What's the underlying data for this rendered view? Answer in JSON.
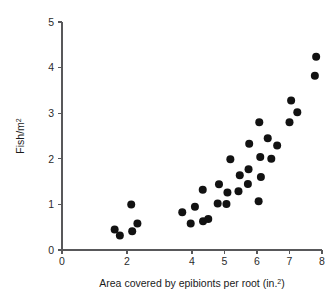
{
  "chart_data": {
    "type": "scatter",
    "title": "",
    "xlabel": "Area covered by epibionts per root (in.²)",
    "ylabel": "Fish/m²",
    "xlabel_main": "Area covered by epibionts per root (in.",
    "xlabel_sup": "2",
    "xlabel_tail": ")",
    "ylabel_main": "Fish/m",
    "ylabel_sup": "2",
    "xlim": [
      0,
      8
    ],
    "ylim": [
      0,
      5
    ],
    "xticks": [
      0,
      2,
      4,
      5,
      6,
      7,
      8
    ],
    "xtick_labels": [
      "0",
      "2",
      "4",
      "5",
      "6",
      "7",
      "8"
    ],
    "yticks": [
      0,
      1,
      2,
      3,
      4,
      5
    ],
    "ytick_labels": [
      "0",
      "1",
      "2",
      "3",
      "4",
      "5"
    ],
    "grid": false,
    "legend": false,
    "marker": "filled-circle",
    "marker_color": "#121212",
    "marker_size": 5.2,
    "n_points": 38,
    "x": [
      1.62,
      1.78,
      2.13,
      2.16,
      2.32,
      3.7,
      3.96,
      4.09,
      4.33,
      4.34,
      4.5,
      4.79,
      4.83,
      5.06,
      5.09,
      5.18,
      5.43,
      5.47,
      5.72,
      5.74,
      5.76,
      6.05,
      6.07,
      6.1,
      6.12,
      6.14,
      6.33,
      6.44,
      6.62,
      7.0,
      7.05,
      7.24,
      7.78,
      7.82,
      2.2,
      4.36,
      5.5,
      6.15
    ],
    "y": [
      0.45,
      0.32,
      1.0,
      0.41,
      0.58,
      0.83,
      0.58,
      0.95,
      1.32,
      0.63,
      0.68,
      1.02,
      1.44,
      1.01,
      1.26,
      1.99,
      1.29,
      1.64,
      1.45,
      1.77,
      2.33,
      1.07,
      2.8,
      2.04,
      1.6,
      1.07,
      2.45,
      2.0,
      2.29,
      2.8,
      3.28,
      3.02,
      3.82,
      4.24,
      1.0,
      0.63,
      1.29,
      2.04
    ],
    "points": [
      {
        "x": 1.62,
        "y": 0.45
      },
      {
        "x": 1.78,
        "y": 0.32
      },
      {
        "x": 2.13,
        "y": 1.0
      },
      {
        "x": 2.16,
        "y": 0.41
      },
      {
        "x": 2.32,
        "y": 0.58
      },
      {
        "x": 3.7,
        "y": 0.83
      },
      {
        "x": 3.96,
        "y": 0.58
      },
      {
        "x": 4.09,
        "y": 0.95
      },
      {
        "x": 4.33,
        "y": 1.32
      },
      {
        "x": 4.34,
        "y": 0.63
      },
      {
        "x": 4.5,
        "y": 0.68
      },
      {
        "x": 4.79,
        "y": 1.02
      },
      {
        "x": 4.83,
        "y": 1.44
      },
      {
        "x": 5.06,
        "y": 1.01
      },
      {
        "x": 5.09,
        "y": 1.26
      },
      {
        "x": 5.18,
        "y": 1.99
      },
      {
        "x": 5.43,
        "y": 1.29
      },
      {
        "x": 5.47,
        "y": 1.64
      },
      {
        "x": 5.72,
        "y": 1.45
      },
      {
        "x": 5.74,
        "y": 1.77
      },
      {
        "x": 5.76,
        "y": 2.33
      },
      {
        "x": 6.05,
        "y": 1.07
      },
      {
        "x": 6.07,
        "y": 2.8
      },
      {
        "x": 6.1,
        "y": 2.04
      },
      {
        "x": 6.12,
        "y": 1.6
      },
      {
        "x": 6.33,
        "y": 2.45
      },
      {
        "x": 6.44,
        "y": 2.0
      },
      {
        "x": 6.62,
        "y": 2.29
      },
      {
        "x": 7.0,
        "y": 2.8
      },
      {
        "x": 7.05,
        "y": 3.28
      },
      {
        "x": 7.24,
        "y": 3.02
      },
      {
        "x": 7.78,
        "y": 3.82
      },
      {
        "x": 7.82,
        "y": 4.24
      }
    ]
  }
}
